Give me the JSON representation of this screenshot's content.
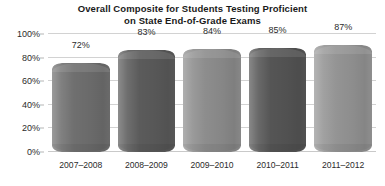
{
  "chart_data": {
    "type": "bar",
    "title": "Overall Composite for Students Testing Proficient on State End-of-Grade Exams",
    "title_lines": [
      "Overall Composite for Students Testing Proficient",
      "on State End-of-Grade Exams"
    ],
    "categories": [
      "2007–2008",
      "2008–2009",
      "2009–2010",
      "2010–2011",
      "2011–2012"
    ],
    "values": [
      72,
      83,
      84,
      85,
      87
    ],
    "value_labels": [
      "72%",
      "83%",
      "84%",
      "85%",
      "87%"
    ],
    "xlabel": "",
    "ylabel": "",
    "ylim": [
      0,
      100
    ],
    "yticks": [
      0,
      20,
      40,
      60,
      80,
      100
    ],
    "ytick_labels": [
      "0%",
      "20%",
      "40%",
      "60%",
      "80%",
      "100%"
    ],
    "grid": true,
    "legend": false,
    "legend_position": "none",
    "series_style": "3d-cylinder",
    "bar_colors": [
      "#6f6f6f",
      "#5b5b5b",
      "#8d8d8d",
      "#555555",
      "#949494"
    ],
    "grid_color": "#d2d2d2",
    "text_color": "#2b2b2b",
    "background": "#ffffff"
  }
}
